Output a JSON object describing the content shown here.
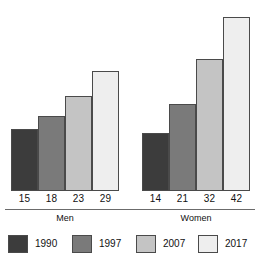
{
  "chart_data": {
    "type": "bar",
    "title": "",
    "xlabel": "",
    "ylabel": "",
    "grid": false,
    "legend_position": "bottom",
    "axis_visible": false,
    "ylim": [
      0,
      42
    ],
    "categories": [
      "Men",
      "Women"
    ],
    "series": [
      {
        "name": "1990",
        "color": "#3c3c3c",
        "values": [
          15,
          14
        ]
      },
      {
        "name": "1997",
        "color": "#7a7a7a",
        "values": [
          18,
          21
        ]
      },
      {
        "name": "2007",
        "color": "#c4c4c4",
        "values": [
          23,
          32
        ]
      },
      {
        "name": "2017",
        "color": "#eeeeee",
        "values": [
          29,
          42
        ]
      }
    ]
  },
  "groups": [
    {
      "label": "Men",
      "bars": [
        {
          "series": "1990",
          "value": 15,
          "value_label": "15",
          "color": "#3c3c3c"
        },
        {
          "series": "1997",
          "value": 18,
          "value_label": "18",
          "color": "#7a7a7a"
        },
        {
          "series": "2007",
          "value": 23,
          "value_label": "23",
          "color": "#c4c4c4"
        },
        {
          "series": "2017",
          "value": 29,
          "value_label": "29",
          "color": "#eeeeee"
        }
      ]
    },
    {
      "label": "Women",
      "bars": [
        {
          "series": "1990",
          "value": 14,
          "value_label": "14",
          "color": "#3c3c3c"
        },
        {
          "series": "1997",
          "value": 21,
          "value_label": "21",
          "color": "#7a7a7a"
        },
        {
          "series": "2007",
          "value": 32,
          "value_label": "32",
          "color": "#c4c4c4"
        },
        {
          "series": "2017",
          "value": 42,
          "value_label": "42",
          "color": "#eeeeee"
        }
      ]
    }
  ],
  "legend": {
    "items": [
      {
        "label": "1990",
        "color": "#3c3c3c"
      },
      {
        "label": "1997",
        "color": "#7a7a7a"
      },
      {
        "label": "2007",
        "color": "#c4c4c4"
      },
      {
        "label": "2017",
        "color": "#eeeeee"
      }
    ]
  },
  "style": {
    "bar_border_color": "#4a4a4a",
    "axis_rule_color": "#6b6b6b",
    "background": "#ffffff",
    "text_color": "#111111",
    "px_per_unit": 4.14,
    "baseline_y": 190
  }
}
